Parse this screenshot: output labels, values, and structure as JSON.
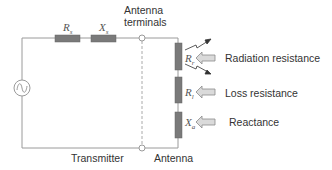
{
  "diagram": {
    "colors": {
      "wire": "#9a9a9a",
      "component_fill": "#7a7a7a",
      "arrow_fill": "#d8d8d8",
      "text": "#333333"
    },
    "transmitter": {
      "label": "Transmitter",
      "source": "ac-voltage-source",
      "components": [
        {
          "id": "Rs",
          "symbol": "R",
          "subscript": "s",
          "name": "source resistance"
        },
        {
          "id": "Xs",
          "symbol": "X",
          "subscript": "s",
          "name": "source reactance"
        }
      ]
    },
    "terminals": {
      "label_line1": "Antenna",
      "label_line2": "terminals"
    },
    "antenna": {
      "label": "Antenna",
      "components": [
        {
          "id": "Rr",
          "symbol": "R",
          "subscript": "r",
          "description": "Radiation resistance"
        },
        {
          "id": "Rl",
          "symbol": "R",
          "subscript": "l",
          "description": "Loss resistance"
        },
        {
          "id": "Xa",
          "symbol": "X",
          "subscript": "a",
          "description": "Reactance"
        }
      ]
    }
  }
}
